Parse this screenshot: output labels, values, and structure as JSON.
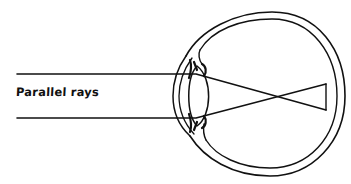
{
  "diagram": {
    "labels": {
      "parallel_rays": "Parallel rays"
    },
    "components": [
      "sclera-outer",
      "sclera-inner",
      "cornea",
      "lens",
      "iris",
      "ciliary-body",
      "retina",
      "parallel-ray-upper",
      "parallel-ray-lower"
    ],
    "colors": {
      "stroke": "#111111",
      "background": "#ffffff"
    }
  }
}
